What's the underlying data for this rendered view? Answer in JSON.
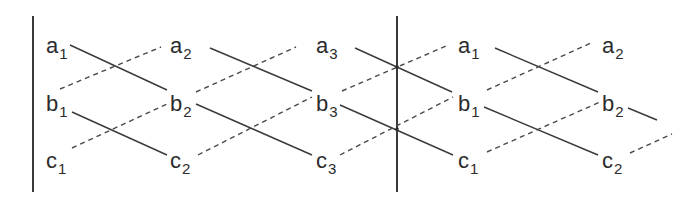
{
  "diagram": {
    "colors": {
      "ink": "#3a3a3a",
      "text": "#2b2b2b",
      "background": "#ffffff"
    },
    "nodes": [
      {
        "id": "a1_left",
        "base": "a",
        "sub": "1",
        "row": "a",
        "col": 1
      },
      {
        "id": "b1_left",
        "base": "b",
        "sub": "1",
        "row": "b",
        "col": 1
      },
      {
        "id": "c1_left",
        "base": "c",
        "sub": "1",
        "row": "c",
        "col": 1
      },
      {
        "id": "a2_left",
        "base": "a",
        "sub": "2",
        "row": "a",
        "col": 2
      },
      {
        "id": "b2_left",
        "base": "b",
        "sub": "2",
        "row": "b",
        "col": 2
      },
      {
        "id": "c2_left",
        "base": "c",
        "sub": "2",
        "row": "c",
        "col": 2
      },
      {
        "id": "a3",
        "base": "a",
        "sub": "3",
        "row": "a",
        "col": 3
      },
      {
        "id": "b3",
        "base": "b",
        "sub": "3",
        "row": "b",
        "col": 3
      },
      {
        "id": "c3",
        "base": "c",
        "sub": "3",
        "row": "c",
        "col": 3
      },
      {
        "id": "a1_right",
        "base": "a",
        "sub": "1",
        "row": "a",
        "col": 4
      },
      {
        "id": "b1_right",
        "base": "b",
        "sub": "1",
        "row": "b",
        "col": 4
      },
      {
        "id": "c1_right",
        "base": "c",
        "sub": "1",
        "row": "c",
        "col": 4
      },
      {
        "id": "a2_right",
        "base": "a",
        "sub": "2",
        "row": "a",
        "col": 5
      },
      {
        "id": "b2_right",
        "base": "b",
        "sub": "2",
        "row": "b",
        "col": 5
      },
      {
        "id": "c2_right",
        "base": "c",
        "sub": "2",
        "row": "c",
        "col": 5
      }
    ],
    "edges": [
      {
        "from": "a1_left",
        "to": "b2_left",
        "style": "solid"
      },
      {
        "from": "b1_left",
        "to": "c2_left",
        "style": "solid"
      },
      {
        "from": "b1_left",
        "to": "a2_left",
        "style": "dashed"
      },
      {
        "from": "c1_left",
        "to": "b2_left",
        "style": "dashed"
      },
      {
        "from": "a2_left",
        "to": "b3",
        "style": "solid"
      },
      {
        "from": "b2_left",
        "to": "c3",
        "style": "solid"
      },
      {
        "from": "b2_left",
        "to": "a3",
        "style": "dashed"
      },
      {
        "from": "c2_left",
        "to": "b3",
        "style": "dashed"
      },
      {
        "from": "a3",
        "to": "b1_right",
        "style": "solid"
      },
      {
        "from": "b3",
        "to": "c1_right",
        "style": "solid"
      },
      {
        "from": "b3",
        "to": "a1_right",
        "style": "dashed"
      },
      {
        "from": "c3",
        "to": "b1_right",
        "style": "dashed"
      },
      {
        "from": "a1_right",
        "to": "b2_right",
        "style": "solid"
      },
      {
        "from": "b1_right",
        "to": "c2_right",
        "style": "solid"
      },
      {
        "from": "b1_right",
        "to": "a2_right",
        "style": "dashed"
      },
      {
        "from": "c1_right",
        "to": "b2_right",
        "style": "dashed"
      },
      {
        "from": "b2_right",
        "to": "continuation",
        "style": "solid"
      },
      {
        "from": "c2_right",
        "to": "continuation",
        "style": "dashed"
      }
    ],
    "boundaries": [
      {
        "id": "left-boundary",
        "position": "left edge"
      },
      {
        "id": "period-boundary",
        "position": "between column 3 and column 4"
      }
    ]
  }
}
